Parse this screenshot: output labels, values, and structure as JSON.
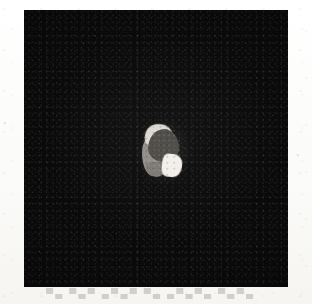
{
  "document": {
    "type": "scanned-page-figure",
    "background_color": "#fdfdfc"
  },
  "showthrough": {
    "note": "faint illegible text bleeding through from the reverse side of the scanned page",
    "bottom_text": "▀▄ ▀▄▀ ▄▀▄▀ ▀▄ ▄▀▄▀▄ ▀▄▀▄",
    "left_text": "▪",
    "right_text": "▪"
  },
  "figure": {
    "panel": {
      "label": "dark-field photomicrograph",
      "background_color": "#0a0a0a",
      "x": 24,
      "y": 10,
      "width": 264,
      "height": 277
    },
    "specimen": {
      "label": "bright central specimen",
      "x": 142,
      "y": 124,
      "width": 40,
      "height": 54,
      "regions": [
        {
          "name": "bright-crescent-rim",
          "color": "#dcd9d2"
        },
        {
          "name": "dark-grey-dome",
          "color": "#4a4845"
        },
        {
          "name": "medium-grey-left-lobe",
          "color": "#8e8b86"
        },
        {
          "name": "white-wedge",
          "color": "#f2efe9"
        },
        {
          "name": "grey-skirt",
          "color": "#7b7873"
        }
      ]
    }
  }
}
